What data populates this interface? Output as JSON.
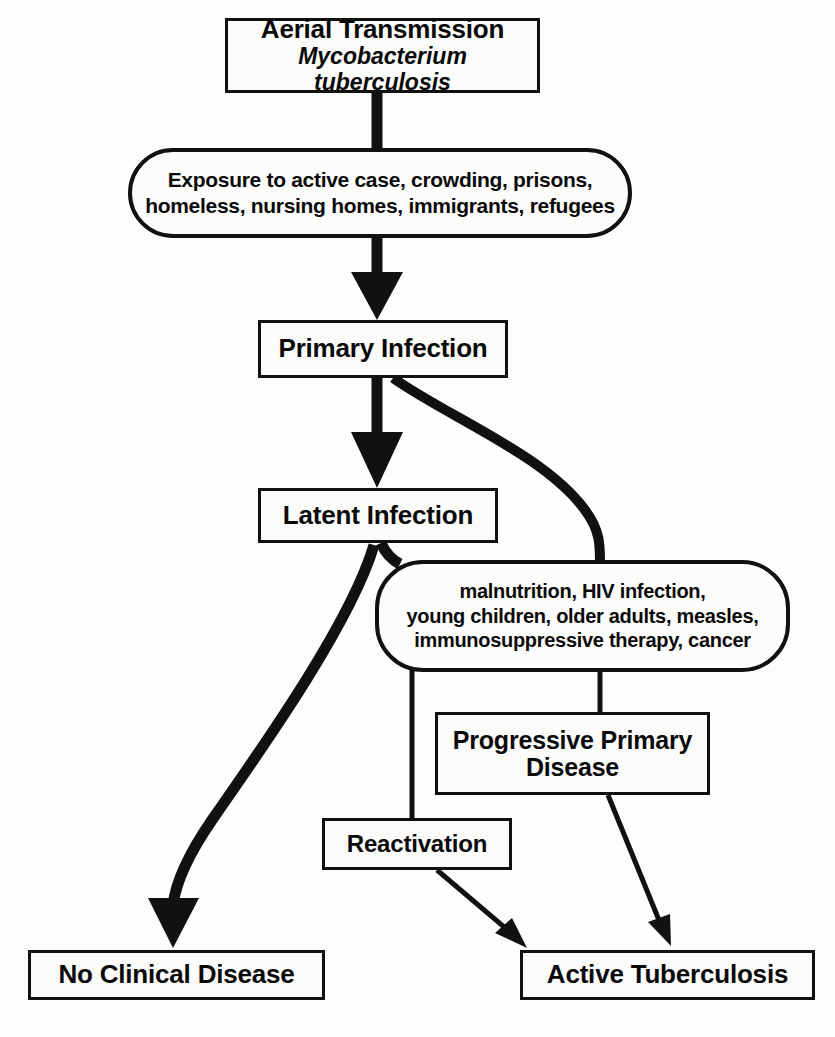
{
  "diagram": {
    "line_color": "#111111",
    "box_fill": "#fbfbfa",
    "background": "#fdfdfc"
  },
  "nodes": {
    "aerial_transmission": {
      "shape": "rectangle",
      "line1": "Aerial Transmission",
      "line2": "Mycobacterium tuberculosis"
    },
    "exposure": {
      "shape": "rounded",
      "line1": "Exposure to active case, crowding, prisons,",
      "line2": "homeless, nursing homes, immigrants, refugees"
    },
    "primary_infection": {
      "shape": "rectangle",
      "label": "Primary Infection"
    },
    "latent_infection": {
      "shape": "rectangle",
      "label": "Latent Infection"
    },
    "risk_factors": {
      "shape": "rounded",
      "line1": "malnutrition, HIV infection,",
      "line2": "young children, older adults, measles,",
      "line3": "immunosuppressive therapy, cancer"
    },
    "progressive_primary_disease": {
      "shape": "rectangle",
      "line1": "Progressive Primary",
      "line2": "Disease"
    },
    "reactivation": {
      "shape": "rectangle",
      "label": "Reactivation"
    },
    "no_clinical_disease": {
      "shape": "rectangle",
      "label": "No Clinical Disease"
    },
    "active_tuberculosis": {
      "shape": "rectangle",
      "label": "Active Tuberculosis"
    }
  },
  "edges": [
    {
      "name": "aerial-to-exposure",
      "from": "aerial_transmission",
      "to": "exposure",
      "style": "thick-straight",
      "arrowhead": false
    },
    {
      "name": "exposure-to-primary",
      "from": "exposure",
      "to": "primary_infection",
      "style": "thick-straight",
      "arrowhead": true
    },
    {
      "name": "primary-to-latent",
      "from": "primary_infection",
      "to": "latent_infection",
      "style": "thick-straight",
      "arrowhead": true
    },
    {
      "name": "primary-to-risk-factors",
      "from": "primary_infection",
      "to": "risk_factors",
      "style": "thick-curve",
      "arrowhead": false
    },
    {
      "name": "latent-to-risk-factors",
      "from": "latent_infection",
      "to": "risk_factors",
      "style": "thick-short",
      "arrowhead": false
    },
    {
      "name": "latent-to-no-clinical-disease",
      "from": "latent_infection",
      "to": "no_clinical_disease",
      "style": "thick-curve",
      "arrowhead": true
    },
    {
      "name": "risk-to-reactivation",
      "from": "risk_factors",
      "to": "reactivation",
      "style": "thin-elbow",
      "arrowhead": false
    },
    {
      "name": "risk-to-progressive-primary",
      "from": "risk_factors",
      "to": "progressive_primary_disease",
      "style": "thin-straight",
      "arrowhead": false
    },
    {
      "name": "reactivation-to-active-tb",
      "from": "reactivation",
      "to": "active_tuberculosis",
      "style": "thin-diagonal",
      "arrowhead": true
    },
    {
      "name": "progressive-to-active-tb",
      "from": "progressive_primary_disease",
      "to": "active_tuberculosis",
      "style": "thin-diagonal",
      "arrowhead": true
    }
  ]
}
